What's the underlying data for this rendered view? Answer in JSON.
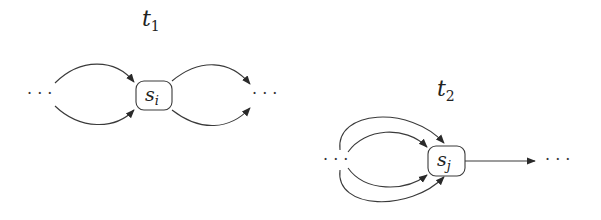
{
  "diagram": {
    "type": "state-transition",
    "stroke_color": "#3a3a3a",
    "panels": [
      {
        "id": "t1",
        "title": {
          "base": "t",
          "sub": "1"
        },
        "node": {
          "base": "s",
          "sub": "i"
        },
        "left_ellipsis": "· · ·",
        "right_ellipsis": "· · ·",
        "incoming_edges": 2,
        "outgoing_edges": 2
      },
      {
        "id": "t2",
        "title": {
          "base": "t",
          "sub": "2"
        },
        "node": {
          "base": "s",
          "sub": "j"
        },
        "left_ellipsis": "· · ·",
        "right_ellipsis": "· · ·",
        "incoming_edges": 4,
        "outgoing_edges": 1
      }
    ]
  }
}
